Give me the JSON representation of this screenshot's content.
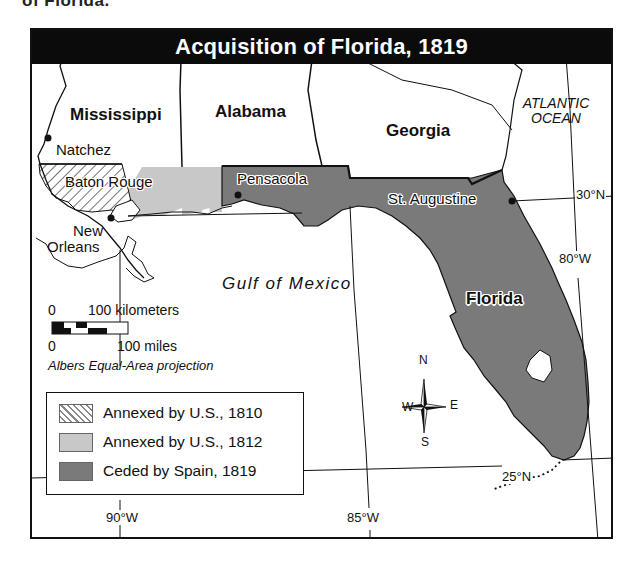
{
  "page": {
    "top_fragment": "of Florida."
  },
  "map": {
    "title": "Acquisition of Florida, 1819",
    "states": {
      "mississippi": "Mississippi",
      "alabama": "Alabama",
      "georgia": "Georgia",
      "florida": "Florida"
    },
    "cities": {
      "natchez": "Natchez",
      "baton_rouge": "Baton Rouge",
      "new_orleans_line1": "New",
      "new_orleans_line2": "Orleans",
      "pensacola": "Pensacola",
      "st_augustine": "St. Augustine"
    },
    "water": {
      "gulf": "Gulf of Mexico",
      "atlantic_line1": "ATLANTIC",
      "atlantic_line2": "OCEAN"
    },
    "coordinates": {
      "lat_30": "30°N",
      "lat_25": "25°N",
      "lon_80": "80°W",
      "lon_85": "85°W",
      "lon_90": "90°W"
    },
    "scale": {
      "km_zero": "0",
      "km_label": "100 kilometers",
      "mi_zero": "0",
      "mi_label": "100 miles",
      "projection": "Albers Equal-Area projection"
    },
    "compass": {
      "n": "N",
      "s": "S",
      "e": "E",
      "w": "W"
    },
    "legend": {
      "items": [
        {
          "label": "Annexed by U.S., 1810",
          "pattern": "hatched",
          "color": "#ffffff"
        },
        {
          "label": "Annexed by U.S., 1812",
          "pattern": "solid",
          "color": "#c8c8c8"
        },
        {
          "label": "Ceded by Spain, 1819",
          "pattern": "solid",
          "color": "#7a7a7a"
        }
      ]
    },
    "colors": {
      "frame": "#111111",
      "title_bar": "#0b0b0b",
      "ceded_1819": "#7a7a7a",
      "annexed_1812": "#c8c8c8",
      "annexed_1810_hatch": "#888888",
      "land": "#ffffff",
      "water": "#ffffff"
    }
  }
}
